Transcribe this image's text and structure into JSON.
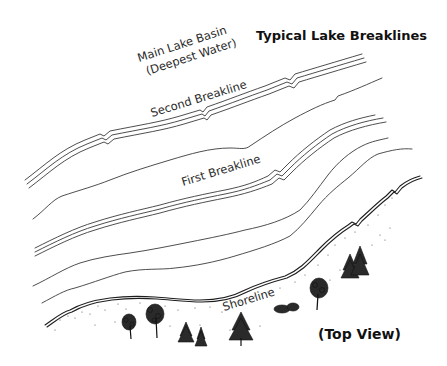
{
  "title": "Typical Lake Breaklines",
  "view_label": "(Top View)",
  "labels": {
    "main_basin_line1": "Main Lake Basin",
    "main_basin_line2": "(Deepest Water)",
    "second_breakline": "Second Breakline",
    "first_breakline": "First Breakline",
    "shoreline": "Shoreline"
  },
  "contours": [
    {
      "name": "second-breakline-edge",
      "style": "triple"
    },
    {
      "name": "contour-a",
      "style": "single"
    },
    {
      "name": "first-breakline-edge",
      "style": "triple"
    },
    {
      "name": "contour-b",
      "style": "single"
    },
    {
      "name": "contour-c",
      "style": "single"
    },
    {
      "name": "shoreline",
      "style": "double"
    }
  ],
  "colors": {
    "background": "#ffffff",
    "ink": "#2a2a2a"
  }
}
